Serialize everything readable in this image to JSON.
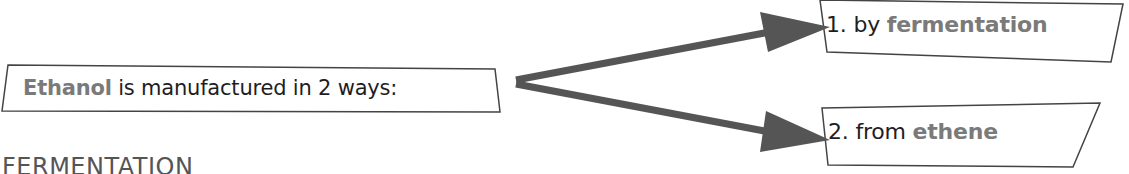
{
  "diagram": {
    "main_box": {
      "highlight": "Ethanol",
      "text": " is manufactured in 2 ways:"
    },
    "ways": [
      {
        "prefix": "1. by ",
        "highlight": "fermentation"
      },
      {
        "prefix": "2. from ",
        "highlight": "ethene"
      }
    ],
    "section_heading": "FERMENTATION",
    "colors": {
      "text": "#1e1e1e",
      "highlight": "#7a7a7a",
      "arrow": "#555555",
      "box_border": "#444444"
    }
  }
}
